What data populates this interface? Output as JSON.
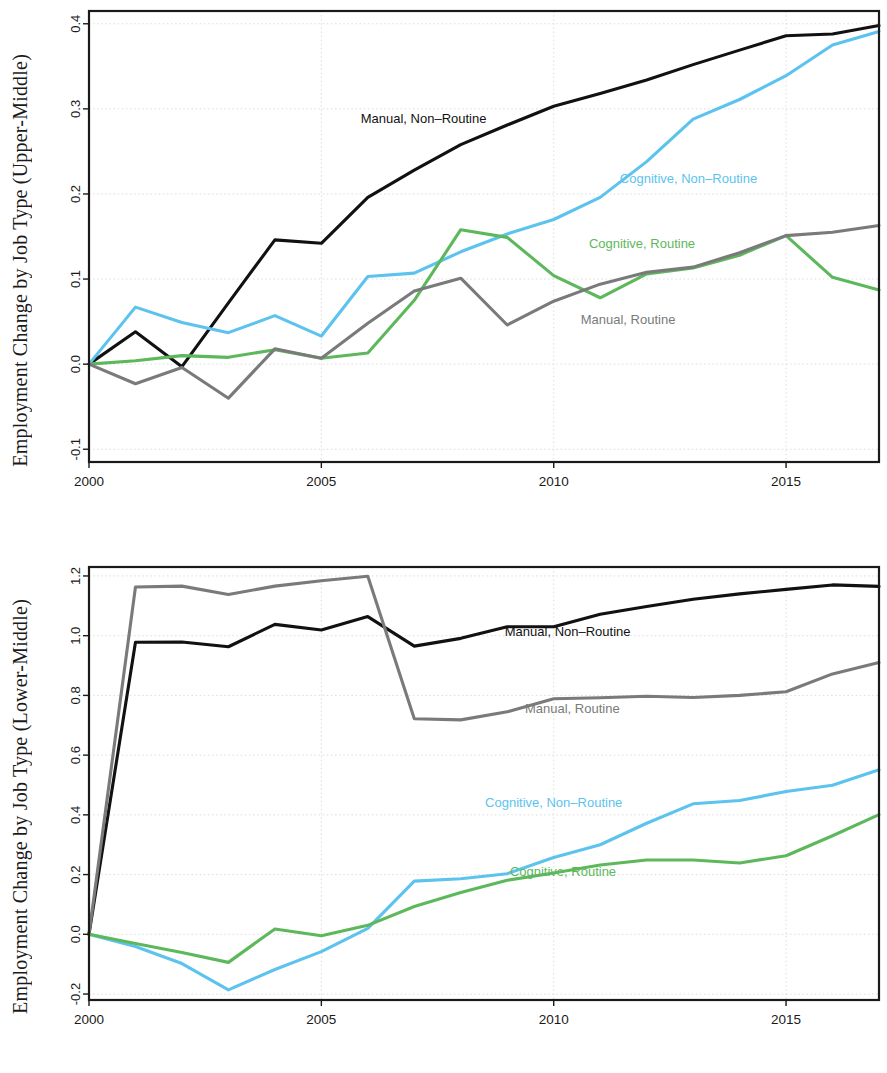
{
  "panels": [
    {
      "id": "upper-middle",
      "ylabel": "Employment Change by Job Type (Upper-Middle)"
    },
    {
      "id": "lower-middle",
      "ylabel": "Employment Change by Job Type (Lower-Middle)"
    }
  ],
  "series_labels": {
    "manual_nonroutine": "Manual, Non–Routine",
    "manual_routine": "Manual, Routine",
    "cognitive_nonroutine": "Cognitive, Non–Routine",
    "cognitive_routine": "Cognitive, Routine"
  },
  "colors": {
    "manual_nonroutine": "#111111",
    "manual_routine": "#7a7a7a",
    "cognitive_nonroutine": "#5cc3ee",
    "cognitive_routine": "#5db85c",
    "grid": "#d9d9d9",
    "frame": "#1a1a1a",
    "background": "#ffffff"
  },
  "chart_data": [
    {
      "type": "line",
      "title": "",
      "xlabel": "",
      "ylabel": "Employment Change by Job Type (Upper-Middle)",
      "x": [
        2000,
        2001,
        2002,
        2003,
        2004,
        2005,
        2006,
        2007,
        2008,
        2009,
        2010,
        2011,
        2012,
        2013,
        2014,
        2015,
        2016,
        2017
      ],
      "xtick_values": [
        2000,
        2005,
        2010,
        2015
      ],
      "xtick_labels": [
        "2000",
        "2005",
        "2010",
        "2015"
      ],
      "ytick_values": [
        -0.1,
        0.0,
        0.1,
        0.2,
        0.3,
        0.4
      ],
      "ytick_labels": [
        "-0.1",
        "0.0",
        "0.1",
        "0.2",
        "0.3",
        "0.4"
      ],
      "xlim": [
        2000,
        2017
      ],
      "ylim": [
        -0.115,
        0.415
      ],
      "grid": true,
      "legend": "inline-annotations",
      "series": [
        {
          "name": "Manual, Non–Routine",
          "key": "manual_nonroutine",
          "color": "#111111",
          "values": [
            0.0,
            0.038,
            -0.003,
            0.072,
            0.146,
            0.142,
            0.196,
            0.228,
            0.258,
            0.281,
            0.303,
            0.318,
            0.334,
            0.352,
            0.369,
            0.386,
            0.388,
            0.398
          ],
          "label_x": 2007.2,
          "label_y": 0.283
        },
        {
          "name": "Cognitive, Non–Routine",
          "key": "cognitive_nonroutine",
          "color": "#5cc3ee",
          "values": [
            0.0,
            0.067,
            0.049,
            0.037,
            0.057,
            0.033,
            0.103,
            0.107,
            0.132,
            0.153,
            0.17,
            0.196,
            0.238,
            0.288,
            0.311,
            0.339,
            0.375,
            0.391
          ],
          "label_x": 2012.9,
          "label_y": 0.213
        },
        {
          "name": "Cognitive, Routine",
          "key": "cognitive_routine",
          "color": "#5db85c",
          "values": [
            0.0,
            0.004,
            0.01,
            0.008,
            0.017,
            0.007,
            0.013,
            0.075,
            0.158,
            0.149,
            0.104,
            0.078,
            0.106,
            0.113,
            0.128,
            0.151,
            0.102,
            0.087
          ],
          "label_x": 2011.9,
          "label_y": 0.136
        },
        {
          "name": "Manual, Routine",
          "key": "manual_routine",
          "color": "#7a7a7a",
          "values": [
            0.0,
            -0.023,
            -0.004,
            -0.04,
            0.018,
            0.007,
            0.048,
            0.086,
            0.101,
            0.046,
            0.074,
            0.094,
            0.108,
            0.114,
            0.131,
            0.151,
            0.155,
            0.163
          ],
          "label_x": 2011.6,
          "label_y": 0.047
        }
      ]
    },
    {
      "type": "line",
      "title": "",
      "xlabel": "",
      "ylabel": "Employment Change by Job Type (Lower-Middle)",
      "x": [
        2000,
        2001,
        2002,
        2003,
        2004,
        2005,
        2006,
        2007,
        2008,
        2009,
        2010,
        2011,
        2012,
        2013,
        2014,
        2015,
        2016,
        2017
      ],
      "xtick_values": [
        2000,
        2005,
        2010,
        2015
      ],
      "xtick_labels": [
        "2000",
        "2005",
        "2010",
        "2015"
      ],
      "ytick_values": [
        -0.2,
        0.0,
        0.2,
        0.4,
        0.6,
        0.8,
        1.0,
        1.2
      ],
      "ytick_labels": [
        "-0.2",
        "0.0",
        "0.2",
        "0.4",
        "0.6",
        "0.8",
        "1.0",
        "1.2"
      ],
      "xlim": [
        2000,
        2017
      ],
      "ylim": [
        -0.22,
        1.23
      ],
      "grid": true,
      "legend": "inline-annotations",
      "series": [
        {
          "name": "Manual, Non–Routine",
          "key": "manual_nonroutine",
          "color": "#111111",
          "values": [
            0.0,
            0.978,
            0.979,
            0.963,
            1.038,
            1.019,
            1.064,
            0.965,
            0.991,
            1.03,
            1.03,
            1.072,
            1.098,
            1.122,
            1.14,
            1.155,
            1.17,
            1.165
          ],
          "label_x": 2010.3,
          "label_y": 0.998
        },
        {
          "name": "Manual, Routine",
          "key": "manual_routine",
          "color": "#7a7a7a",
          "values": [
            0.0,
            1.163,
            1.166,
            1.138,
            1.166,
            1.184,
            1.199,
            0.722,
            0.718,
            0.745,
            0.789,
            0.792,
            0.797,
            0.793,
            0.8,
            0.812,
            0.872,
            0.91
          ],
          "label_x": 2010.4,
          "label_y": 0.742
        },
        {
          "name": "Cognitive, Non–Routine",
          "key": "cognitive_nonroutine",
          "color": "#5cc3ee",
          "values": [
            0.0,
            -0.041,
            -0.098,
            -0.186,
            -0.118,
            -0.058,
            0.02,
            0.178,
            0.186,
            0.203,
            0.257,
            0.3,
            0.372,
            0.437,
            0.448,
            0.478,
            0.499,
            0.551
          ],
          "label_x": 2010.0,
          "label_y": 0.425
        },
        {
          "name": "Cognitive, Routine",
          "key": "cognitive_routine",
          "color": "#5db85c",
          "values": [
            0.0,
            -0.031,
            -0.061,
            -0.094,
            0.018,
            -0.005,
            0.03,
            0.093,
            0.14,
            0.181,
            0.205,
            0.232,
            0.249,
            0.249,
            0.239,
            0.263,
            0.33,
            0.401
          ],
          "label_x": 2010.2,
          "label_y": 0.194
        }
      ]
    }
  ]
}
